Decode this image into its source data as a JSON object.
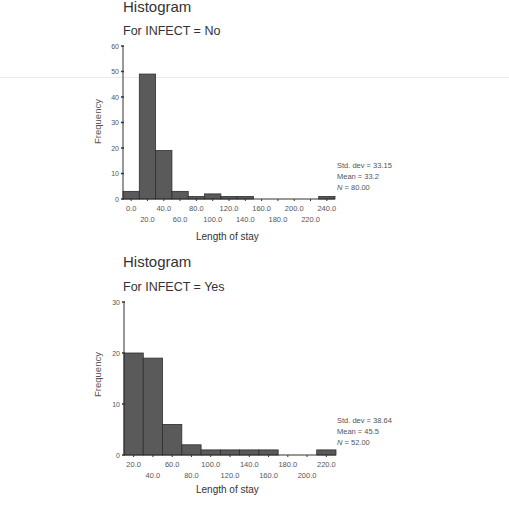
{
  "colors": {
    "bar_fill": "#5a5a5a",
    "bar_stroke": "#2e2e2e",
    "axis": "#333333",
    "text": "#555555"
  },
  "chart_data": [
    {
      "type": "bar",
      "title": "Histogram",
      "subtitle": "For INFECT = No",
      "xlabel": "Length of stay",
      "ylabel": "Frequency",
      "categories": [
        "0.0",
        "20.0",
        "40.0",
        "60.0",
        "80.0",
        "100.0",
        "120.0",
        "140.0",
        "160.0",
        "180.0",
        "200.0",
        "220.0",
        "240.0"
      ],
      "values": [
        3,
        49,
        19,
        3,
        1,
        2,
        1,
        1,
        0,
        0,
        0,
        0,
        1
      ],
      "yticks": [
        0,
        10,
        20,
        30,
        40,
        50,
        60
      ],
      "ylim": [
        0,
        60
      ],
      "xtick_row1": [
        "0.0",
        "40.0",
        "80.0",
        "120.0",
        "160.0",
        "200.0",
        "240.0"
      ],
      "xtick_row2": [
        "20.0",
        "60.0",
        "100.0",
        "140.0",
        "180.0",
        "220.0"
      ],
      "stats": {
        "std_dev": "Std. dev = 33.15",
        "mean": "Mean = 33.2",
        "n_label": "N",
        "n_value": " = 80.00"
      },
      "grid": false
    },
    {
      "type": "bar",
      "title": "Histogram",
      "subtitle": "For INFECT = Yes",
      "xlabel": "Length of stay",
      "ylabel": "Frequency",
      "categories": [
        "20.0",
        "40.0",
        "60.0",
        "80.0",
        "100.0",
        "120.0",
        "140.0",
        "160.0",
        "180.0",
        "200.0",
        "220.0"
      ],
      "values": [
        20,
        19,
        6,
        2,
        1,
        1,
        1,
        1,
        0,
        0,
        1
      ],
      "yticks": [
        0,
        10,
        20,
        30
      ],
      "ylim": [
        0,
        30
      ],
      "xtick_row1": [
        "20.0",
        "60.0",
        "100.0",
        "140.0",
        "180.0",
        "220.0"
      ],
      "xtick_row2": [
        "40.0",
        "80.0",
        "120.0",
        "160.0",
        "200.0"
      ],
      "stats": {
        "std_dev": "Std. dev = 38.64",
        "mean": "Mean = 45.5",
        "n_label": "N",
        "n_value": " = 52.00"
      },
      "grid": false
    }
  ]
}
